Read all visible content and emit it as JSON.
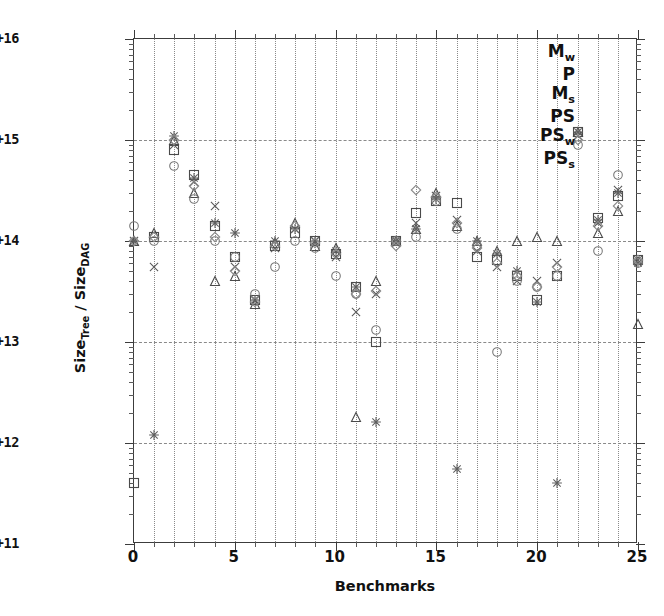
{
  "chart_data": {
    "type": "scatter",
    "title": "",
    "xlabel": "Benchmarks",
    "ylabel": "SizeTree / SizeDAG",
    "ylabel_parts": {
      "prefix": "Size",
      "sub1": "Tree",
      "mid": " / Size",
      "sub2": "DAG"
    },
    "xlim": [
      0,
      25
    ],
    "ylim": [
      100000000000.0,
      1e+16
    ],
    "yscale": "log",
    "xscale": "linear",
    "grid": true,
    "grid_style": "dotted vertical at every integer, dashed horizontal at decades",
    "legend_position": "top-right",
    "x_ticks": [
      0,
      5,
      10,
      15,
      20,
      25
    ],
    "x_tick_labels": [
      "0",
      "5",
      "10",
      "15",
      "20",
      "25"
    ],
    "x_minor_ticks": [
      1,
      2,
      3,
      4,
      6,
      7,
      8,
      9,
      11,
      12,
      13,
      14,
      16,
      17,
      18,
      19,
      21,
      22,
      23,
      24
    ],
    "y_ticks": [
      100000000000.0,
      1000000000000.0,
      10000000000000.0,
      100000000000000.0,
      1000000000000000.0,
      1e+16
    ],
    "y_tick_labels": [
      "1e+11",
      "1e+12",
      "1e+13",
      "1e+14",
      "1e+15",
      "1e+16"
    ],
    "categories": [
      0,
      1,
      2,
      3,
      4,
      5,
      6,
      7,
      8,
      9,
      10,
      11,
      12,
      13,
      14,
      15,
      16,
      17,
      18,
      19,
      20,
      21,
      22,
      23,
      24,
      25
    ],
    "series": [
      {
        "name": "Mw",
        "label_prefix": "M",
        "label_sub": "w",
        "marker": "square",
        "color": "#4a4a4a",
        "values": [
          400000000000.0,
          110000000000000.0,
          800000000000000.0,
          450000000000000.0,
          140000000000000.0,
          70000000000000.0,
          26000000000000.0,
          90000000000000.0,
          120000000000000.0,
          100000000000000.0,
          75000000000000.0,
          35000000000000.0,
          10000000000000.0,
          100000000000000.0,
          190000000000000.0,
          250000000000000.0,
          240000000000000.0,
          70000000000000.0,
          65000000000000.0,
          45000000000000.0,
          26000000000000.0,
          45000000000000.0,
          1200000000000000.0,
          170000000000000.0,
          280000000000000.0,
          65000000000000.0
        ]
      },
      {
        "name": "P",
        "label_prefix": "P",
        "label_sub": "",
        "marker": "triangle",
        "color": "#4a4a4a",
        "values": [
          100000000000000.0,
          120000000000000.0,
          1000000000000000.0,
          300000000000000.0,
          40000000000000.0,
          45000000000000.0,
          24000000000000.0,
          95000000000000.0,
          150000000000000.0,
          90000000000000.0,
          85000000000000.0,
          1800000000000.0,
          40000000000000.0,
          100000000000000.0,
          130000000000000.0,
          300000000000000.0,
          140000000000000.0,
          100000000000000.0,
          80000000000000.0,
          100000000000000.0,
          110000000000000.0,
          100000000000000.0,
          1200000000000000.0,
          120000000000000.0,
          200000000000000.0,
          15000000000000.0
        ]
      },
      {
        "name": "Ms",
        "label_prefix": "M",
        "label_sub": "s",
        "marker": "x",
        "color": "#5a5a5a",
        "values": [
          100000000000000.0,
          55000000000000.0,
          900000000000000.0,
          380000000000000.0,
          220000000000000.0,
          55000000000000.0,
          26000000000000.0,
          85000000000000.0,
          130000000000000.0,
          100000000000000.0,
          70000000000000.0,
          20000000000000.0,
          30000000000000.0,
          95000000000000.0,
          150000000000000.0,
          280000000000000.0,
          160000000000000.0,
          80000000000000.0,
          55000000000000.0,
          40000000000000.0,
          40000000000000.0,
          60000000000000.0,
          1100000000000000.0,
          150000000000000.0,
          320000000000000.0,
          65000000000000.0
        ]
      },
      {
        "name": "PS",
        "label_prefix": "PS",
        "label_sub": "",
        "marker": "star",
        "color": "#606060",
        "values": [
          100000000000000.0,
          1200000000000.0,
          1100000000000000.0,
          420000000000000.0,
          150000000000000.0,
          120000000000000.0,
          26000000000000.0,
          100000000000000.0,
          130000000000000.0,
          100000000000000.0,
          80000000000000.0,
          35000000000000.0,
          1600000000000.0,
          100000000000000.0,
          130000000000000.0,
          260000000000000.0,
          550000000000.0,
          100000000000000.0,
          75000000000000.0,
          50000000000000.0,
          25000000000000.0,
          400000000000.0,
          1200000000000000.0,
          160000000000000.0,
          300000000000000.0,
          60000000000000.0
        ]
      },
      {
        "name": "PSw",
        "label_prefix": "PS",
        "label_sub": "w",
        "marker": "circle",
        "color": "#7a7a7a",
        "values": [
          140000000000000.0,
          100000000000000.0,
          550000000000000.0,
          260000000000000.0,
          100000000000000.0,
          70000000000000.0,
          30000000000000.0,
          55000000000000.0,
          100000000000000.0,
          85000000000000.0,
          45000000000000.0,
          30000000000000.0,
          13000000000000.0,
          100000000000000.0,
          110000000000000.0,
          250000000000000.0,
          130000000000000.0,
          90000000000000.0,
          8000000000000.0,
          40000000000000.0,
          35000000000000.0,
          45000000000000.0,
          900000000000000.0,
          80000000000000.0,
          450000000000000.0,
          60000000000000.0
        ]
      },
      {
        "name": "PSs",
        "label_prefix": "PS",
        "label_sub": "s",
        "marker": "diamond",
        "color": "#8a8a8a",
        "values": [
          100000000000000.0,
          110000000000000.0,
          1000000000000000.0,
          350000000000000.0,
          110000000000000.0,
          50000000000000.0,
          25000000000000.0,
          90000000000000.0,
          140000000000000.0,
          95000000000000.0,
          75000000000000.0,
          30000000000000.0,
          32000000000000.0,
          90000000000000.0,
          320000000000000.0,
          270000000000000.0,
          150000000000000.0,
          85000000000000.0,
          60000000000000.0,
          45000000000000.0,
          35000000000000.0,
          55000000000000.0,
          1000000000000000.0,
          140000000000000.0,
          220000000000000.0,
          65000000000000.0
        ]
      }
    ]
  }
}
